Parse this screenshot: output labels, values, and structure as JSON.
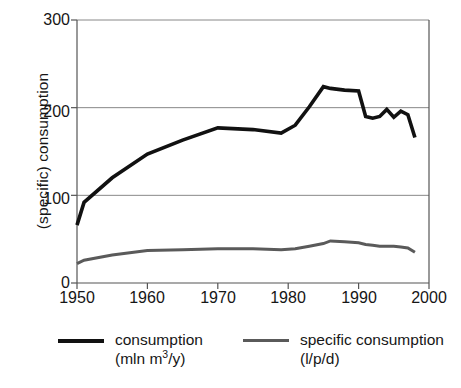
{
  "chart_data": {
    "type": "line",
    "title": "",
    "xlabel": "",
    "ylabel": "(specific) consumption",
    "xlim": [
      1950,
      2000
    ],
    "ylim": [
      0,
      300
    ],
    "xticks": [
      1950,
      1960,
      1970,
      1980,
      1990,
      2000
    ],
    "yticks": [
      0,
      100,
      200,
      300
    ],
    "grid": "horizontal",
    "legend_position": "bottom",
    "x": [
      1950,
      1951,
      1955,
      1960,
      1965,
      1970,
      1975,
      1979,
      1981,
      1983,
      1985,
      1986,
      1988,
      1990,
      1991,
      1992,
      1993,
      1994,
      1995,
      1996,
      1997,
      1998
    ],
    "series": [
      {
        "name": "consumption",
        "unit": "mln m3/y",
        "color": "#111111",
        "width": 3.6,
        "values": [
          66,
          92,
          120,
          147,
          163,
          177,
          175,
          171,
          180,
          201,
          224,
          222,
          220,
          219,
          190,
          188,
          190,
          198,
          189,
          196,
          192,
          166
        ]
      },
      {
        "name": "specific consumption",
        "unit": "l/p/d",
        "color": "#5a5a5a",
        "width": 3.0,
        "values": [
          22,
          26,
          32,
          37,
          38,
          39,
          39,
          38,
          39,
          42,
          45,
          48,
          47,
          46,
          44,
          43,
          42,
          42,
          42,
          41,
          40,
          35
        ]
      }
    ]
  },
  "axes": {
    "y_tick_labels": [
      "300",
      "200",
      "100",
      "0"
    ],
    "x_tick_labels": [
      "1950",
      "1960",
      "1970",
      "1980",
      "1990",
      "2000"
    ],
    "y_axis_title": "(specific) consumption"
  },
  "legend": {
    "items": [
      {
        "line1": "consumption",
        "unit_prefix": "(mln m",
        "unit_sup": "3",
        "unit_suffix": "/y)",
        "color": "#111111"
      },
      {
        "line1": "specific consumption",
        "unit_prefix": "(l/p/d)",
        "unit_sup": "",
        "unit_suffix": "",
        "color": "#5a5a5a"
      }
    ]
  },
  "style": {
    "axis_color": "#555555",
    "grid_color": "#888888",
    "background": "#ffffff"
  }
}
